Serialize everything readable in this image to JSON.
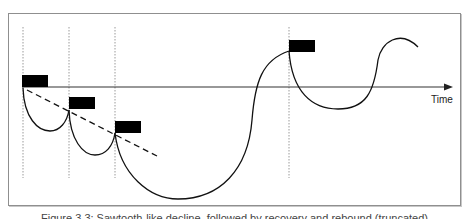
{
  "figure": {
    "axis_label": "Time",
    "caption": "Figure 3.3: Sawtooth-like decline, followed by recovery and rebound (truncated)",
    "colors": {
      "line": "#111111",
      "marker": "#000000",
      "guide": "#9a9a9a",
      "frame": "#8f8f8f"
    },
    "markers": [
      {
        "label": "marker-1",
        "x": 22,
        "y": 75
      },
      {
        "label": "marker-2",
        "x": 69,
        "y": 97
      },
      {
        "label": "marker-3",
        "x": 115,
        "y": 121
      },
      {
        "label": "marker-4",
        "x": 289,
        "y": 40
      }
    ],
    "guides_x": [
      23,
      69,
      115,
      289
    ],
    "trend_line": "dashed declining line through first three markers"
  }
}
